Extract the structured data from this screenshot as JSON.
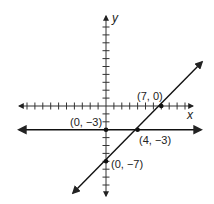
{
  "chart_data": {
    "type": "line",
    "title": "",
    "xlabel": "x",
    "ylabel": "y",
    "grid": false,
    "xlim": [
      -11,
      11
    ],
    "ylim": [
      -12,
      12
    ],
    "series": [
      {
        "name": "horizontal line y = -3",
        "points": [
          [
            0,
            -3
          ],
          [
            4,
            -3
          ]
        ]
      },
      {
        "name": "slanted line through (0,-7) and (7,0)",
        "points": [
          [
            0,
            -7
          ],
          [
            4,
            -3
          ],
          [
            7,
            0
          ]
        ]
      }
    ],
    "points": [
      {
        "label": "(7, 0)",
        "x": 7,
        "y": 0
      },
      {
        "label": "(0, −3)",
        "x": 0,
        "y": -3
      },
      {
        "label": "(4, −3)",
        "x": 4,
        "y": -3
      },
      {
        "label": "(0, −7)",
        "x": 0,
        "y": -7
      }
    ]
  },
  "axes": {
    "x_label": "x",
    "y_label": "y",
    "color": "#222222"
  },
  "labels": {
    "p70": "(7, 0)",
    "p0m3": "(0, −3)",
    "p4m3": "(4, −3)",
    "p0m7": "(0, −7)"
  }
}
